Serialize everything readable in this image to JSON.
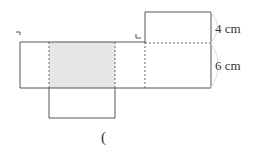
{
  "diagram": {
    "type": "net of rectangular prism",
    "labels": {
      "height_top": "4 cm",
      "height_main": "6 cm",
      "answer_paren": "("
    },
    "colors": {
      "line": "#555555",
      "shaded_face": "#e6e6e6",
      "brace": "#dddddd"
    }
  }
}
